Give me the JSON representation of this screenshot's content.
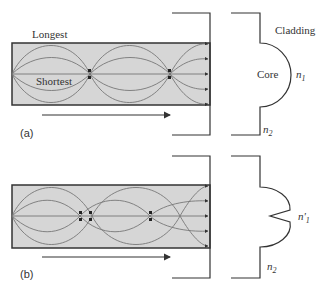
{
  "figure": {
    "panel_a": {
      "label": "(a)",
      "ray_labels": {
        "longest": "Longest",
        "shortest": "Shortest"
      },
      "profile": {
        "cladding_label": "Cladding",
        "core_label": "Core",
        "core_index": "n",
        "core_index_sub": "1",
        "cladding_index": "n",
        "cladding_index_sub": "2",
        "shape": "parabolic"
      }
    },
    "panel_b": {
      "label": "(b)",
      "profile": {
        "core_index": "n'",
        "core_index_sub": "1",
        "cladding_index": "n",
        "cladding_index_sub": "2",
        "shape": "parabolic-with-central-dip"
      }
    },
    "colors": {
      "core_fill": "#d6d6d6",
      "line": "#333333",
      "ray": "#666666"
    }
  }
}
